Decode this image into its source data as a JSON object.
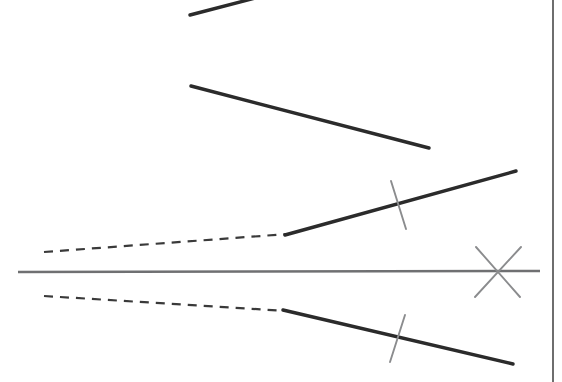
{
  "figure": {
    "canvas": {
      "width": 562,
      "height": 382
    },
    "background_color": "#ffffff",
    "colors": {
      "dark_stroke": "#2b2b2b",
      "gray_stroke": "#6f7072",
      "light_gray_stroke": "#8b8c8e",
      "border_stroke": "#4a4a4a"
    },
    "vertex": {
      "label": "vertex",
      "x": 135,
      "y": 272
    }
  },
  "elements": {
    "top_segment": {
      "name": "top oblique segment",
      "x1": 190,
      "y1": 15,
      "x2": 263,
      "y2": -4,
      "stroke": "#2b2b2b",
      "width": 3.4,
      "style": "solid"
    },
    "second_segment": {
      "name": "second oblique segment",
      "x1": 191,
      "y1": 86,
      "x2": 429,
      "y2": 148,
      "stroke": "#2b2b2b",
      "width": 3.4,
      "style": "solid"
    },
    "horizontal_axis": {
      "name": "horizontal base line",
      "x1": 18,
      "y1": 272,
      "x2": 540,
      "y2": 271,
      "stroke": "#6f7072",
      "width": 2.6,
      "style": "solid"
    },
    "upper_ray_solid": {
      "name": "upper solid ray",
      "x1": 285,
      "y1": 235,
      "x2": 516,
      "y2": 171,
      "stroke": "#2b2b2b",
      "width": 3.4,
      "style": "solid"
    },
    "upper_ray_dashed": {
      "name": "upper dashed construction line",
      "x1": 44,
      "y1": 252,
      "x2": 288,
      "y2": 234,
      "stroke": "#3a3a3a",
      "width": 2.2,
      "style": "dashed",
      "dash": "9 7"
    },
    "lower_ray_solid": {
      "name": "lower solid ray",
      "x1": 283,
      "y1": 310,
      "x2": 513,
      "y2": 364,
      "stroke": "#2b2b2b",
      "width": 3.4,
      "style": "solid"
    },
    "lower_ray_dashed": {
      "name": "lower dashed construction line",
      "x1": 44,
      "y1": 296,
      "x2": 287,
      "y2": 311,
      "stroke": "#3a3a3a",
      "width": 2.2,
      "style": "dashed",
      "dash": "9 7"
    },
    "tick_upper": {
      "name": "congruence tick on upper ray",
      "x1": 391,
      "y1": 181,
      "x2": 406,
      "y2": 229,
      "stroke": "#8b8c8e",
      "width": 1.9,
      "style": "solid"
    },
    "tick_lower": {
      "name": "congruence tick on lower ray",
      "x1": 405,
      "y1": 315,
      "x2": 390,
      "y2": 362,
      "stroke": "#8b8c8e",
      "width": 1.9,
      "style": "solid"
    },
    "cross_mark": {
      "name": "x cross mark on base line",
      "center_x": 497,
      "center_y": 272,
      "stroke_1": {
        "x1": 476,
        "y1": 247,
        "x2": 520,
        "y2": 297
      },
      "stroke_2": {
        "x1": 521,
        "y1": 247,
        "x2": 475,
        "y2": 297
      },
      "stroke": "#8b8c8e",
      "width": 1.9,
      "style": "solid"
    },
    "right_border": {
      "name": "page right border rule",
      "x1": 553,
      "y1": 0,
      "x2": 553,
      "y2": 382,
      "stroke": "#4a4a4a",
      "width": 1.6,
      "style": "solid"
    }
  }
}
